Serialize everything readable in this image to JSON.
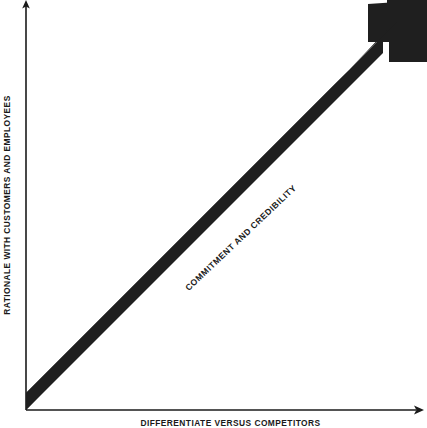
{
  "diagram": {
    "type": "arrow-quadrant-diagram",
    "background_color": "#ffffff",
    "ink_color": "#1a1a1a",
    "axes": {
      "y_label": "RATIONALE WITH CUSTOMERS AND EMPLOYEES",
      "x_label": "DIFFERENTIATE VERSUS COMPETITORS",
      "y_axis_name": "vertical-axis",
      "x_axis_name": "horizontal-axis",
      "origin": {
        "x": 26,
        "y": 410
      },
      "y_top": {
        "x": 26,
        "y": 2
      },
      "x_right": {
        "x": 424,
        "y": 410
      }
    },
    "arrow": {
      "label": "COMMITMENT AND CREDIBILITY",
      "direction": "up-right",
      "fill_color": "#1f1f1f",
      "start": {
        "x": 26,
        "y": 410
      },
      "end": {
        "x": 427,
        "y": 0
      },
      "band_thickness_px": 24,
      "head_style": "block-chevron"
    }
  }
}
